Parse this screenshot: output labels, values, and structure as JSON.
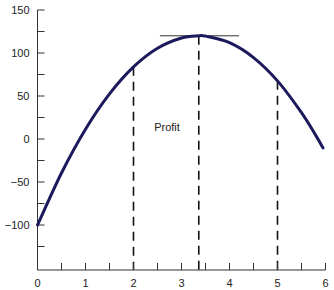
{
  "chart_data": {
    "type": "line",
    "title": "",
    "xlabel": "",
    "ylabel": "",
    "xlim": [
      0,
      6
    ],
    "ylim": [
      -150,
      150
    ],
    "grid": false,
    "legend": null,
    "x_ticks": [
      0,
      1,
      2,
      3,
      4,
      5,
      6
    ],
    "x_tick_labels": [
      "0",
      "1",
      "2",
      "3",
      "4",
      "5",
      "6"
    ],
    "x_minor_step": 0.5,
    "y_ticks": [
      -100,
      -50,
      0,
      50,
      100,
      150
    ],
    "y_tick_labels": [
      "−100",
      "−50",
      "0",
      "50",
      "100",
      "150"
    ],
    "y_minor_step": 25,
    "series": [
      {
        "name": "Profit",
        "color": "#1c1a5c",
        "x": [
          0,
          0.5,
          1,
          1.5,
          2,
          2.5,
          3,
          3.36,
          3.5,
          4,
          4.5,
          5,
          5.5,
          5.8,
          5.95
        ],
        "y": [
          -100,
          -39.5,
          11.4,
          52.5,
          83.9,
          105.6,
          117.5,
          120,
          119.6,
          112.0,
          94.7,
          67.6,
          30.7,
          3.9,
          -10.5
        ]
      }
    ],
    "annotations": [
      {
        "type": "text",
        "text": "Profit",
        "x": 2.4,
        "y": 14
      },
      {
        "type": "vline-dashed",
        "x": 2,
        "y_top": 83.9
      },
      {
        "type": "vline-dashed",
        "x": 3.36,
        "y_top": 120
      },
      {
        "type": "vline-dashed",
        "x": 5,
        "y_top": 67.6
      },
      {
        "type": "hline-tangent",
        "y": 120,
        "x_from": 2.55,
        "x_to": 4.2
      }
    ]
  }
}
